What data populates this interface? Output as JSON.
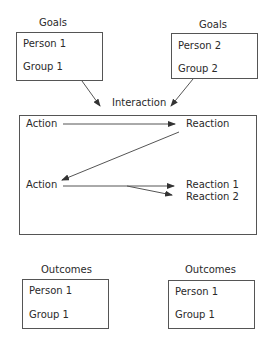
{
  "goals": [
    {
      "label": "Goals",
      "lines": [
        "Person 1",
        "Group 1"
      ]
    },
    {
      "label": "Goals",
      "lines": [
        "Person 2",
        "Group 2"
      ]
    }
  ],
  "interaction": {
    "label": "Interaction",
    "row1": {
      "action": "Action",
      "reaction": "Reaction"
    },
    "row2": {
      "action": "Action",
      "reactions": [
        "Reaction 1",
        "Reaction 2"
      ]
    }
  },
  "outcomes": [
    {
      "label": "Outcomes",
      "lines": [
        "Person 1",
        "Group 1"
      ]
    },
    {
      "label": "Outcomes",
      "lines": [
        "Person 1",
        "Group 1"
      ]
    }
  ],
  "colors": {
    "line": "#555555",
    "text": "#2a2a2a"
  }
}
